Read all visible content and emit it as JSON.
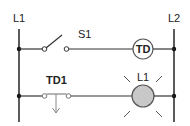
{
  "diagram": {
    "type": "ladder-logic",
    "rails": {
      "left": {
        "label": "L1"
      },
      "right": {
        "label": "L2"
      }
    },
    "rungs": [
      {
        "components": [
          {
            "type": "normally-open-switch",
            "label": "S1"
          },
          {
            "type": "timer-coil",
            "label": "TD"
          }
        ]
      },
      {
        "components": [
          {
            "type": "timed-closed-contact",
            "label": "TD1"
          },
          {
            "type": "lamp",
            "label": "L1",
            "state": "lit"
          }
        ]
      }
    ],
    "colors": {
      "line": "#333333",
      "lamp_fill": "#c8c8c8",
      "coil_fill": "#ffffff"
    }
  }
}
